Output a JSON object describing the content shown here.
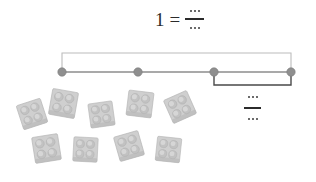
{
  "canvas": {
    "width": 316,
    "height": 182,
    "background": "#ffffff"
  },
  "equation": {
    "whole": "1",
    "equals": "=",
    "numerator": "…",
    "denominator": "…",
    "ink_color": "#2b2b2b"
  },
  "number_line": {
    "line_color": "#8c8c8c",
    "dot_color": "#8f8f8f",
    "dot_edge_color": "#7a7a7a",
    "top_brace_color": "#bcbcbc",
    "bottom_brace_color": "#4a4a4a",
    "x_start": 62,
    "x_end": 291,
    "y": 72,
    "dot_radius": 4.2,
    "ticks": [
      {
        "label": "",
        "x": 62
      },
      {
        "label": "",
        "x": 138
      },
      {
        "label": "",
        "x": 214
      },
      {
        "label": "",
        "x": 291
      }
    ],
    "top_brace": {
      "from_x": 62,
      "to_x": 291,
      "y": 53,
      "label": ""
    },
    "bottom_brace": {
      "from_x": 214,
      "to_x": 291,
      "y": 85,
      "label": ""
    }
  },
  "lower_fraction": {
    "numerator": "…",
    "denominator": "…",
    "ink_color": "#2b2b2b"
  },
  "blocks": {
    "count": 9,
    "type": "2x2-lego-brick",
    "body_color": "#cfcfcf",
    "stud_color": "#c2c2c2",
    "shade_color": "#b4b4b4",
    "items": [
      {
        "x": 18,
        "y": 100,
        "rotate": -18,
        "size": 28
      },
      {
        "x": 49,
        "y": 89,
        "rotate": 10,
        "size": 29
      },
      {
        "x": 88,
        "y": 101,
        "rotate": -8,
        "size": 27
      },
      {
        "x": 126,
        "y": 90,
        "rotate": 7,
        "size": 28
      },
      {
        "x": 166,
        "y": 93,
        "rotate": -24,
        "size": 28
      },
      {
        "x": 32,
        "y": 134,
        "rotate": -9,
        "size": 29
      },
      {
        "x": 72,
        "y": 136,
        "rotate": 3,
        "size": 27
      },
      {
        "x": 115,
        "y": 132,
        "rotate": -16,
        "size": 28
      },
      {
        "x": 155,
        "y": 136,
        "rotate": 6,
        "size": 27
      }
    ]
  }
}
